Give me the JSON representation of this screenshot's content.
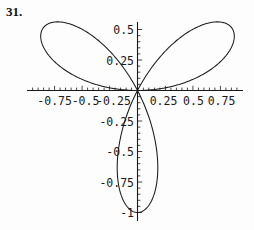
{
  "figure": {
    "problem_number": "31.",
    "caption": ""
  },
  "chart_data": {
    "type": "line",
    "title": "",
    "subtitle": "",
    "xlabel": "",
    "ylabel": "",
    "curve_name": "three-petal rose",
    "polar_equation": "r = cos(3*theta)",
    "orientation_note": "one petal points straight down; other two petals point upper-left and upper-right",
    "petal_count": 3,
    "petal_tip_angles_deg": [
      30,
      150,
      270
    ],
    "petal_tip_radius": 1,
    "grid": false,
    "legend": false,
    "xlim": [
      -1,
      1
    ],
    "ylim": [
      -1,
      0.6
    ],
    "x_ticks": [
      -0.75,
      -0.5,
      -0.25,
      0.25,
      0.5,
      0.75
    ],
    "x_tick_labels": [
      "-0.75",
      "-0.5",
      "-0.25",
      "0.25",
      "0.5",
      "0.75"
    ],
    "y_ticks": [
      0.5,
      0.25,
      -0.25,
      -0.5,
      -0.75,
      -1
    ],
    "y_tick_labels": [
      "0.5",
      "0.25",
      "-0.25",
      "-0.5",
      "-0.75",
      "-1"
    ],
    "x_minor_tick_step": 0.05,
    "y_minor_tick_step": 0.05,
    "curve_color": "#1a1a1a",
    "axis_color": "#1a1a1a",
    "background_color": "#ffffff",
    "petal_tips_xy": [
      [
        0.866,
        0.5
      ],
      [
        -0.866,
        0.5
      ],
      [
        0.0,
        -1.0
      ]
    ]
  },
  "axes": {
    "x_axis_label": "",
    "y_axis_label": ""
  }
}
